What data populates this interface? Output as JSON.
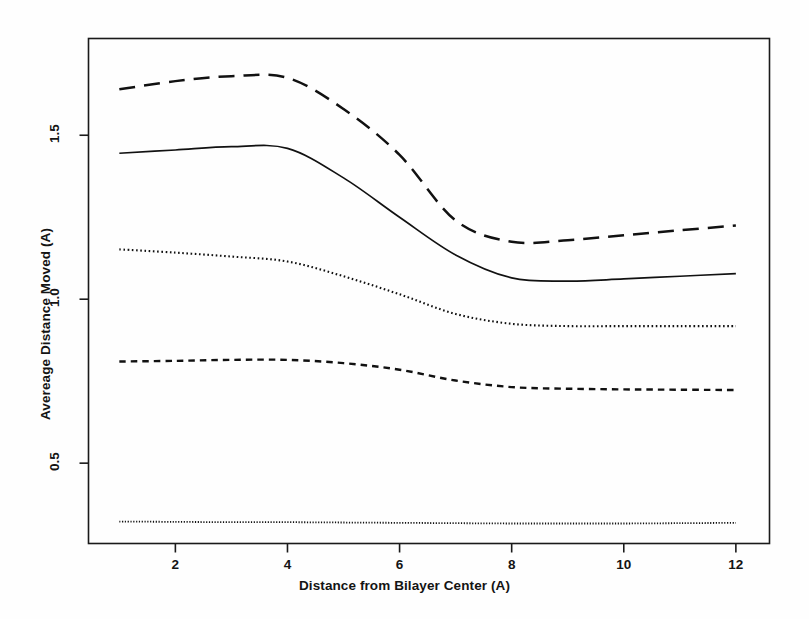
{
  "chart_data": {
    "type": "line",
    "title": "",
    "subtitle": "",
    "xlabel": "Distance from Bilayer Center (A)",
    "ylabel": "Avereage Distance Moved (A)",
    "xlim": [
      0.45,
      12.6
    ],
    "ylim": [
      0.255,
      1.795
    ],
    "xticks": [
      2,
      4,
      6,
      8,
      10,
      12
    ],
    "xtick_labels": [
      "2",
      "4",
      "6",
      "8",
      "10",
      "12"
    ],
    "yticks": [
      0.5,
      1.0,
      1.5
    ],
    "ytick_labels": [
      "0.5",
      "1.0",
      "1.5"
    ],
    "grid": false,
    "legend": "none",
    "frame": true,
    "x": [
      1,
      2,
      3,
      4,
      5,
      6,
      7,
      8,
      9,
      10,
      11,
      12
    ],
    "series": [
      {
        "name": "series-1-long-dash",
        "style": "long-dashed",
        "values": [
          1.64,
          1.665,
          1.68,
          1.675,
          1.58,
          1.44,
          1.24,
          1.175,
          1.18,
          1.195,
          1.21,
          1.225
        ]
      },
      {
        "name": "series-2-solid",
        "style": "solid",
        "values": [
          1.445,
          1.455,
          1.465,
          1.46,
          1.37,
          1.25,
          1.135,
          1.065,
          1.055,
          1.062,
          1.07,
          1.078
        ]
      },
      {
        "name": "series-3-dotted",
        "style": "dotted",
        "values": [
          1.152,
          1.142,
          1.13,
          1.115,
          1.07,
          1.015,
          0.955,
          0.925,
          0.918,
          0.918,
          0.918,
          0.918
        ]
      },
      {
        "name": "series-4-short-dash",
        "style": "short-dashed",
        "values": [
          0.81,
          0.812,
          0.815,
          0.815,
          0.805,
          0.785,
          0.752,
          0.732,
          0.727,
          0.725,
          0.724,
          0.723
        ]
      },
      {
        "name": "series-5-fine-dotted",
        "style": "fine-dotted",
        "values": [
          0.322,
          0.321,
          0.32,
          0.32,
          0.319,
          0.318,
          0.317,
          0.316,
          0.316,
          0.316,
          0.317,
          0.318
        ]
      }
    ]
  },
  "axes": {
    "x_title": "Distance from Bilayer Center (A)",
    "y_title": "Avereage Distance Moved (A)",
    "x_tick_labels": [
      "2",
      "4",
      "6",
      "8",
      "10",
      "12"
    ],
    "y_tick_labels": [
      "0.5",
      "1.0",
      "1.5"
    ]
  },
  "colors": {
    "line": "#111111",
    "frame": "#1a1a1a",
    "background": "#ffffff",
    "text": "#141414"
  }
}
